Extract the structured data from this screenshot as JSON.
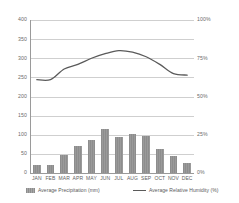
{
  "chart_data": {
    "type": "bar",
    "title": "",
    "subtitle": "",
    "xlabel": "",
    "ylabel": "",
    "ylabel_right": "",
    "grid": true,
    "legend_position": "bottom",
    "categories": [
      "JAN",
      "FEB",
      "MAR",
      "APR",
      "MAY",
      "JUN",
      "JUL",
      "AUG",
      "SEP",
      "OCT",
      "NOV",
      "DEC"
    ],
    "series": [
      {
        "name": "Average Precipitation (mm)",
        "type": "bar",
        "axis": "left",
        "color": "#8d8d8d",
        "values": [
          21,
          20,
          46,
          71,
          86,
          115,
          95,
          102,
          97,
          62,
          44,
          27
        ]
      },
      {
        "name": "Average Relative Humidity (%)",
        "type": "line",
        "axis": "right",
        "color": "#5a5a5a",
        "values": [
          61,
          61,
          68,
          71,
          75,
          78,
          80,
          79,
          76,
          71,
          65,
          64
        ]
      }
    ],
    "y_left": {
      "ticks": [
        "0",
        "50",
        "100",
        "150",
        "200",
        "250",
        "300",
        "350",
        "400"
      ],
      "min": 0,
      "max": 400
    },
    "y_right": {
      "ticks": [
        "0%",
        "25%",
        "50%",
        "75%",
        "100%"
      ],
      "min": 0,
      "max": 100
    }
  },
  "legend": {
    "precipitation_label": "Average Precipitation (mm)",
    "humidity_label": "Average Relative Humidity (%)"
  }
}
